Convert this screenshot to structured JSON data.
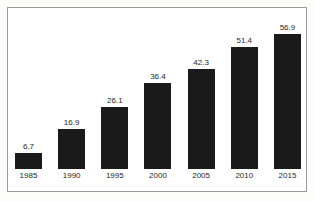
{
  "chart_data": {
    "type": "bar",
    "title": "",
    "subtitle": "",
    "xlabel": "",
    "ylabel": "",
    "categories": [
      "1985",
      "1990",
      "1995",
      "2000",
      "2005",
      "2010",
      "2015"
    ],
    "values": [
      6.7,
      16.9,
      26.1,
      36.4,
      42.3,
      51.4,
      56.9
    ],
    "value_labels": [
      "6.7",
      "16.9",
      "26.1",
      "36.4",
      "42.3",
      "51.4",
      "56.9"
    ],
    "series": [
      {
        "name": "",
        "values": [
          6.7,
          16.9,
          26.1,
          36.4,
          42.3,
          51.4,
          56.9
        ]
      }
    ],
    "ylim": [
      0,
      56.9
    ],
    "grid": false,
    "legend": false,
    "legend_position": "none",
    "axis_lines": false,
    "data_labels": true,
    "bar_color": "#1a1a1a",
    "background_color": "#ffffff",
    "frame_color": "#9a9a9a",
    "text_color": "#1f1f1f"
  },
  "figure": {
    "frame_name": "chart-border"
  }
}
